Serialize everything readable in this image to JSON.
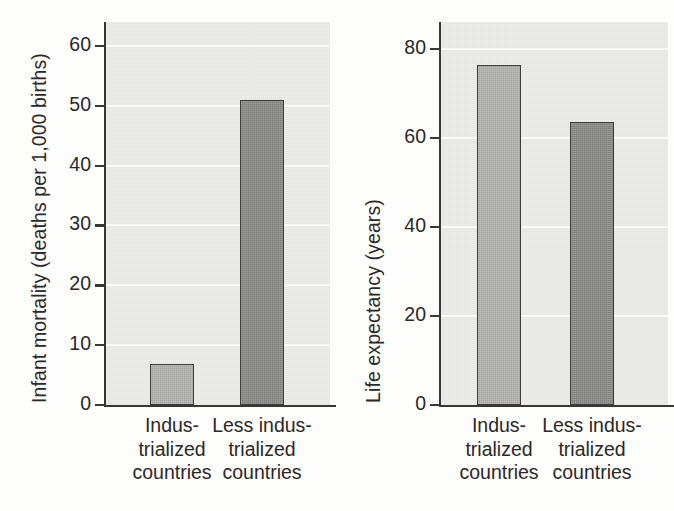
{
  "figure": {
    "background_color": "#fdfdfc",
    "plot_background_color": "#ebebe9",
    "axis_color": "#3a3634",
    "gridline_color": "#fafafa",
    "bar_colors": {
      "industrialized": "#b4b4b2",
      "less_industrialized": "#8b8b89"
    }
  },
  "chart_data": [
    {
      "type": "bar",
      "title": "",
      "xlabel": "",
      "ylabel": "Infant mortality (deaths per 1,000 births)",
      "categories": [
        "Indus-\ntrialized\ncountries",
        "Less indus-\ntrialized\ncountries"
      ],
      "values": [
        6.8,
        51
      ],
      "ylim": [
        0,
        64
      ],
      "yticks": [
        0,
        10,
        20,
        30,
        40,
        50,
        60
      ],
      "ytick_labels": [
        "0",
        "10",
        "20",
        "30",
        "40",
        "50",
        "60"
      ],
      "grid": true,
      "legend": "none",
      "bar_fill_colors": [
        "#b4b4b2",
        "#8b8b89"
      ]
    },
    {
      "type": "bar",
      "title": "",
      "xlabel": "",
      "ylabel": "Life expectancy (years)",
      "categories": [
        "Indus-\ntrialized\ncountries",
        "Less indus-\ntrialized\ncountries"
      ],
      "values": [
        76.3,
        63.5
      ],
      "ylim": [
        0,
        86
      ],
      "yticks": [
        0,
        20,
        40,
        60,
        80
      ],
      "ytick_labels": [
        "0",
        "20",
        "40",
        "60",
        "80"
      ],
      "grid": true,
      "legend": "none",
      "bar_fill_colors": [
        "#b4b4b2",
        "#8b8b89"
      ]
    }
  ]
}
